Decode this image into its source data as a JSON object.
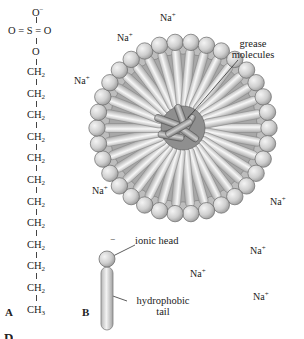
{
  "figure": {
    "panel_a": {
      "letter": "A",
      "sulfate": {
        "top_o": "O",
        "top_o_charge": "−",
        "left_o": "O",
        "left_bond": "=",
        "s": "S",
        "right_bond": "=",
        "right_o": "O",
        "bridge_o": "O"
      },
      "chain": {
        "ch2_label": "CH",
        "ch2_sub": "2",
        "ch2_count": 11,
        "terminal_label": "CH",
        "terminal_sub": "3"
      }
    },
    "panel_b": {
      "letter": "B",
      "labels": {
        "grease_line1": "grease",
        "grease_line2": "molecules",
        "ionic_head": "ionic head",
        "head_charge": "−",
        "hydrophobic_line1": "hydrophobic",
        "hydrophobic_line2": "tail"
      },
      "counter_ion": {
        "symbol": "Na",
        "charge": "+"
      },
      "counter_ion_positions": [
        {
          "x": 160,
          "y": 10
        },
        {
          "x": 117,
          "y": 30
        },
        {
          "x": 74,
          "y": 73
        },
        {
          "x": 92,
          "y": 183
        },
        {
          "x": 270,
          "y": 194
        },
        {
          "x": 250,
          "y": 243
        },
        {
          "x": 190,
          "y": 266
        },
        {
          "x": 253,
          "y": 289
        }
      ],
      "colors": {
        "head_fill": "#d4d4d4",
        "head_stroke": "#6a6a6a",
        "tail_fill": "#e6e6e6",
        "tail_stroke": "#8a8a8a",
        "core_fill": "#9a9a9a"
      }
    },
    "caption_partial": "D"
  }
}
